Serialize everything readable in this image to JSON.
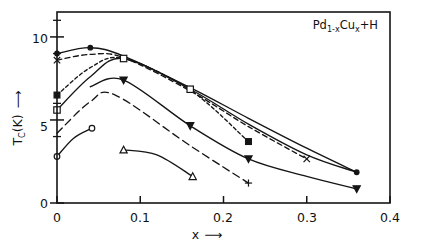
{
  "figure": {
    "annotation": {
      "prefix": "Pd",
      "sub1": "1-x",
      "mid": "Cu",
      "sub2": "x",
      "suffix": "+H",
      "plain": "Pd1-xCux+H"
    }
  },
  "axes": {
    "x": {
      "label": "x",
      "arrow": "⟶",
      "ticks": [
        "0",
        "0.1",
        "0.2",
        "0.3",
        "0.4"
      ],
      "tick_values": [
        0,
        0.1,
        0.2,
        0.3,
        0.4
      ],
      "range": [
        0,
        0.4
      ]
    },
    "y": {
      "label": "T",
      "label_sub": "C",
      "label_unit": "(K)",
      "arrow": "⟶",
      "ticks": [
        "0",
        "5",
        "10"
      ],
      "tick_values": [
        0,
        5,
        10
      ],
      "minor_tick_values": [
        4,
        6,
        9,
        11
      ],
      "range": [
        0,
        11.5
      ]
    }
  },
  "chart_data": {
    "type": "line",
    "title": "Pd1-xCux+H",
    "xlabel": "x",
    "ylabel": "Tc (K)",
    "xlim": [
      0,
      0.4
    ],
    "ylim": [
      0,
      11.5
    ],
    "grid": false,
    "legend": "none",
    "series": [
      {
        "name": "solid-filled-circle",
        "marker": "filled-circle",
        "line": "solid",
        "points": [
          {
            "x": 0.0,
            "y": 9.0
          },
          {
            "x": 0.04,
            "y": 9.35
          },
          {
            "x": 0.08,
            "y": 8.85
          },
          {
            "x": 0.16,
            "y": 6.95
          },
          {
            "x": 0.23,
            "y": 5.1
          },
          {
            "x": 0.3,
            "y": 3.3
          },
          {
            "x": 0.36,
            "y": 1.85
          }
        ],
        "markers_at": [
          {
            "x": 0.0,
            "y": 9.0
          },
          {
            "x": 0.04,
            "y": 9.35
          },
          {
            "x": 0.36,
            "y": 1.85
          }
        ]
      },
      {
        "name": "dashed-cross-x",
        "marker": "cross-x",
        "line": "dashed",
        "points": [
          {
            "x": 0.0,
            "y": 8.6
          },
          {
            "x": 0.04,
            "y": 8.95
          },
          {
            "x": 0.08,
            "y": 8.75
          },
          {
            "x": 0.16,
            "y": 6.75
          },
          {
            "x": 0.23,
            "y": 4.6
          },
          {
            "x": 0.3,
            "y": 2.65
          }
        ],
        "markers_at": [
          {
            "x": 0.0,
            "y": 8.6
          },
          {
            "x": 0.3,
            "y": 2.65
          }
        ]
      },
      {
        "name": "solid-open-square",
        "marker": "open-square",
        "line": "solid",
        "points": [
          {
            "x": 0.0,
            "y": 5.6
          },
          {
            "x": 0.04,
            "y": 7.6
          },
          {
            "x": 0.08,
            "y": 8.7
          },
          {
            "x": 0.16,
            "y": 6.85
          },
          {
            "x": 0.23,
            "y": 4.75
          },
          {
            "x": 0.3,
            "y": 2.9
          },
          {
            "x": 0.36,
            "y": 1.85
          }
        ],
        "markers_at": [
          {
            "x": 0.0,
            "y": 5.6
          },
          {
            "x": 0.08,
            "y": 8.7
          },
          {
            "x": 0.16,
            "y": 6.85
          }
        ]
      },
      {
        "name": "dash-fine-filled-square",
        "marker": "filled-square",
        "line": "dashed-fine",
        "points": [
          {
            "x": 0.0,
            "y": 6.5
          },
          {
            "x": 0.04,
            "y": 8.15
          },
          {
            "x": 0.08,
            "y": 8.7
          },
          {
            "x": 0.16,
            "y": 6.8
          },
          {
            "x": 0.23,
            "y": 3.7
          }
        ],
        "markers_at": [
          {
            "x": 0.0,
            "y": 6.5
          },
          {
            "x": 0.23,
            "y": 3.7
          }
        ]
      },
      {
        "name": "solid-filled-triangle-down",
        "marker": "filled-triangle-down",
        "line": "solid",
        "points": [
          {
            "x": 0.04,
            "y": 7.0
          },
          {
            "x": 0.08,
            "y": 7.4
          },
          {
            "x": 0.16,
            "y": 4.65
          },
          {
            "x": 0.23,
            "y": 2.65
          },
          {
            "x": 0.3,
            "y": 1.6
          },
          {
            "x": 0.36,
            "y": 0.85
          }
        ],
        "markers_at": [
          {
            "x": 0.08,
            "y": 7.4
          },
          {
            "x": 0.16,
            "y": 4.65
          },
          {
            "x": 0.23,
            "y": 2.65
          },
          {
            "x": 0.36,
            "y": 0.85
          }
        ]
      },
      {
        "name": "dash-long-plus",
        "marker": "plus",
        "line": "dashed-long",
        "points": [
          {
            "x": 0.0,
            "y": 4.2
          },
          {
            "x": 0.04,
            "y": 6.1
          },
          {
            "x": 0.07,
            "y": 6.5
          },
          {
            "x": 0.16,
            "y": 3.45
          },
          {
            "x": 0.23,
            "y": 1.2
          }
        ],
        "markers_at": [
          {
            "x": 0.23,
            "y": 1.2
          }
        ]
      },
      {
        "name": "solid-open-circle",
        "marker": "open-circle",
        "line": "solid",
        "points": [
          {
            "x": 0.0,
            "y": 2.8
          },
          {
            "x": 0.02,
            "y": 3.9
          },
          {
            "x": 0.042,
            "y": 4.5
          }
        ],
        "markers_at": [
          {
            "x": 0.0,
            "y": 2.8
          },
          {
            "x": 0.042,
            "y": 4.5
          }
        ]
      },
      {
        "name": "solid-open-triangle-up",
        "marker": "open-triangle-up",
        "line": "solid",
        "points": [
          {
            "x": 0.08,
            "y": 3.2
          },
          {
            "x": 0.12,
            "y": 2.9
          },
          {
            "x": 0.163,
            "y": 1.6
          }
        ],
        "markers_at": [
          {
            "x": 0.08,
            "y": 3.2
          },
          {
            "x": 0.163,
            "y": 1.6
          }
        ]
      }
    ]
  }
}
